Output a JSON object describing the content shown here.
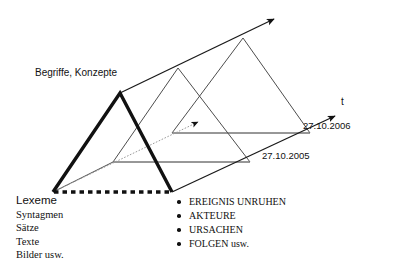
{
  "diagram": {
    "title_label": "Begriffe, Konzepte",
    "axis": {
      "time_axis_label": "t",
      "time_axis_name": "t-axis",
      "date_front": "27.10.2005",
      "date_back": "27.10.2006"
    },
    "arrows": {
      "depth_arrow_name": "depth-axis-arrow",
      "time_arrow_name": "time-axis-arrow",
      "inner_arrow_name": "inner-gray-arrow"
    },
    "shapes": {
      "bold_triangle_name": "bold-front-triangle",
      "middle_triangle_name": "middle-triangle",
      "back_triangle_name": "back-triangle",
      "dashed_base_name": "dashed-base-line"
    },
    "colors": {
      "stroke": "#1a1a1a",
      "thin_stroke": "#4d4d4d",
      "gray_stroke": "#8a8a8a",
      "background": "#ffffff"
    }
  },
  "left_list": {
    "name": "lexeme-list",
    "items": [
      "Lexeme",
      "Syntagmen",
      "Sätze",
      "Texte",
      "Bilder usw."
    ]
  },
  "right_list": {
    "name": "ereignis-list",
    "items": [
      "EREIGNIS UNRUHEN",
      "AKTEURE",
      "URSACHEN",
      "FOLGEN usw."
    ]
  }
}
